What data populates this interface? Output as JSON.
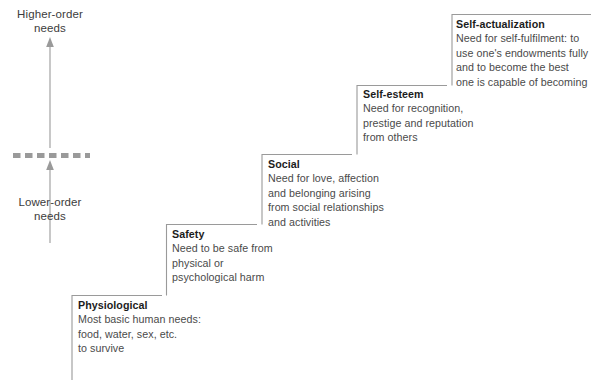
{
  "figure": {
    "axis": {
      "higher_label": "Higher-order\nneeds",
      "lower_label": "Lower-order\nneeds"
    },
    "colors": {
      "line": "#9a9a9a",
      "text": "#3c3c3c",
      "title": "#1c1c1c",
      "background": "#ffffff"
    },
    "steps": [
      {
        "id": "physiological",
        "title": "Physiological",
        "description": "Most basic human needs:\nfood, water, sex, etc.\nto survive"
      },
      {
        "id": "safety",
        "title": "Safety",
        "description": "Need to be safe from\nphysical or\npsychological harm"
      },
      {
        "id": "social",
        "title": "Social",
        "description": "Need for love, affection\nand belonging arising\nfrom social relationships\nand activities"
      },
      {
        "id": "self-esteem",
        "title": "Self-esteem",
        "description": "Need for recognition,\nprestige and reputation\nfrom others"
      },
      {
        "id": "self-actualization",
        "title": "Self-actualization",
        "description": "Need for self-fulfilment: to\nuse one's endowments fully\nand to become the best\none is capable of becoming"
      }
    ]
  }
}
